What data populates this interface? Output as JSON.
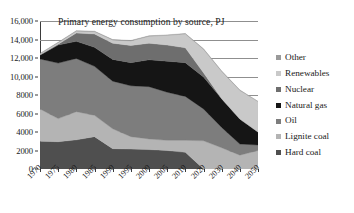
{
  "chart_data": {
    "type": "area",
    "stacked": true,
    "title": "Primary energy consumption by source, PJ",
    "xlabel": "",
    "ylabel": "",
    "ylim": [
      0,
      16000
    ],
    "grid": true,
    "legend_position": "right",
    "categories": [
      "1970",
      "1975",
      "1980",
      "1985",
      "1990",
      "1995",
      "2000",
      "2005",
      "2010",
      "2020",
      "2030",
      "2040",
      "2050"
    ],
    "ytick_labels": [
      "0",
      "2000",
      "4000",
      "6000",
      "8000",
      "10,000",
      "12,000",
      "14,000",
      "16,000"
    ],
    "ytick_values": [
      0,
      2000,
      4000,
      6000,
      8000,
      10000,
      12000,
      14000,
      16000
    ],
    "series": [
      {
        "name": "Hard coal",
        "color": "#4f4f4f",
        "values": [
          3000,
          2950,
          3150,
          3500,
          2200,
          2150,
          2100,
          2000,
          1800,
          0,
          0,
          0,
          0
        ]
      },
      {
        "name": "Lignite coal",
        "color": "#b4b4b4",
        "values": [
          3500,
          2500,
          3050,
          2300,
          2150,
          1350,
          1150,
          1100,
          1300,
          3050,
          2300,
          1500,
          2000
        ]
      },
      {
        "name": "Oil",
        "color": "#7d7d7d",
        "values": [
          5400,
          6000,
          5750,
          5300,
          5150,
          5500,
          5650,
          5200,
          4750,
          3450,
          2200,
          1200,
          600
        ]
      },
      {
        "name": "Natural gas",
        "color": "#151515",
        "values": [
          400,
          1950,
          1850,
          2050,
          2350,
          2500,
          2900,
          3350,
          3650,
          3450,
          3100,
          2700,
          1400
        ]
      },
      {
        "name": "Nuclear",
        "color": "#6e6e6e",
        "values": [
          50,
          100,
          900,
          1450,
          1750,
          1850,
          1800,
          1750,
          1600,
          450,
          0,
          0,
          0
        ]
      },
      {
        "name": "Renewables",
        "color": "#c9c9c9",
        "values": [
          100,
          150,
          200,
          250,
          350,
          500,
          750,
          1050,
          1500,
          2550,
          2950,
          3100,
          3300
        ]
      },
      {
        "name": "Other",
        "color": "#9a9a9a",
        "values": [
          50,
          50,
          50,
          50,
          50,
          50,
          50,
          50,
          50,
          50,
          50,
          50,
          0
        ]
      }
    ]
  },
  "legend": {
    "items": [
      {
        "label": "Other",
        "color": "#9a9a9a"
      },
      {
        "label": "Renewables",
        "color": "#c9c9c9"
      },
      {
        "label": "Nuclear",
        "color": "#6e6e6e"
      },
      {
        "label": "Natural gas",
        "color": "#151515"
      },
      {
        "label": "Oil",
        "color": "#7d7d7d"
      },
      {
        "label": "Lignite coal",
        "color": "#b4b4b4"
      },
      {
        "label": "Hard coal",
        "color": "#4f4f4f"
      }
    ]
  }
}
